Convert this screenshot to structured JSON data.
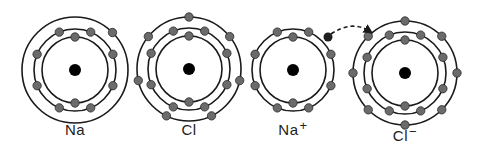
{
  "colors": {
    "ring": "#1a1a1a",
    "electron_fill": "#6b6b6b",
    "electron_stroke": "#2a2a2a",
    "nucleus": "#000000",
    "transferred_electron": "#1f1f1f",
    "label": "#222222"
  },
  "atoms": [
    {
      "id": "na",
      "label": "Na",
      "charge": "",
      "center": [
        75,
        70
      ],
      "shells": [
        {
          "r": 33,
          "electrons": 2,
          "start_deg": -90
        },
        {
          "r": 41,
          "electrons": 8,
          "start_deg": -112.5
        },
        {
          "r": 53,
          "electrons": 1,
          "start_deg": -45
        }
      ],
      "label_pos": [
        75,
        121
      ]
    },
    {
      "id": "cl",
      "label": "Cl",
      "charge": "",
      "center": [
        189,
        69
      ],
      "shells": [
        {
          "r": 33,
          "electrons": 2,
          "start_deg": -90
        },
        {
          "r": 41,
          "electrons": 8,
          "start_deg": -112.5
        },
        {
          "r": 52,
          "electrons": 7,
          "start_deg": -90,
          "step_deg": 51.43
        }
      ],
      "label_pos": [
        189,
        121
      ]
    },
    {
      "id": "na-ion",
      "label": "Na",
      "charge": "+",
      "center": [
        293,
        70
      ],
      "shells": [
        {
          "r": 33,
          "electrons": 2,
          "start_deg": -90
        },
        {
          "r": 41,
          "electrons": 8,
          "start_deg": -112.5
        }
      ],
      "label_pos": [
        293,
        118
      ]
    },
    {
      "id": "cl-ion",
      "label": "Cl",
      "charge": "−",
      "center": [
        405,
        73
      ],
      "shells": [
        {
          "r": 33,
          "electrons": 2,
          "start_deg": -90
        },
        {
          "r": 41,
          "electrons": 8,
          "start_deg": -112.5
        },
        {
          "r": 52,
          "electrons": 8,
          "start_deg": -90
        }
      ],
      "label_pos": [
        405,
        124
      ]
    }
  ],
  "transfer": {
    "electron": [
      328,
      37
    ],
    "arrow_path": "M 331 34 Q 352 20 369 31",
    "arrow_head": [
      369,
      32
    ]
  }
}
